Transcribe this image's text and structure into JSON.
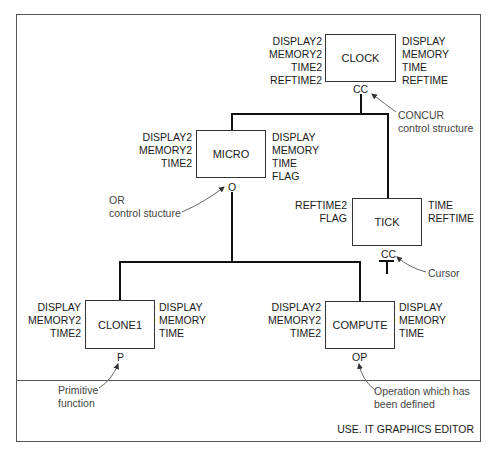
{
  "footer": {
    "title": "USE. IT GRAPHICS EDITOR"
  },
  "nodes": {
    "clock": {
      "name": "CLOCK",
      "inputs": [
        "DISPLAY2",
        "MEMORY2",
        "TIME2",
        "REFTIME2"
      ],
      "outputs": [
        "DISPLAY",
        "MEMORY",
        "TIME",
        "REFTIME"
      ],
      "control": "CC"
    },
    "micro": {
      "name": "MICRO",
      "inputs": [
        "DISPLAY2",
        "MEMORY2",
        "TIME2"
      ],
      "outputs": [
        "DISPLAY",
        "MEMORY",
        "TIME",
        "FLAG"
      ],
      "control": "O"
    },
    "tick": {
      "name": "TICK",
      "inputs": [
        "REFTIME2",
        "FLAG"
      ],
      "outputs": [
        "TIME",
        "REFTIME"
      ],
      "control": "CC"
    },
    "clone1": {
      "name": "CLONE1",
      "inputs": [
        "DISPLAY",
        "MEMORY2",
        "TIME2"
      ],
      "outputs": [
        "DISPLAY",
        "MEMORY",
        "TIME"
      ],
      "control": "P"
    },
    "compute": {
      "name": "COMPUTE",
      "inputs": [
        "DISPLAY2",
        "MEMORY2",
        "TIME2"
      ],
      "outputs": [
        "DISPLAY",
        "MEMORY",
        "TIME"
      ],
      "control": "OP"
    }
  },
  "annotations": {
    "concur": [
      "CONCUR",
      "control structure"
    ],
    "or": [
      "OR",
      "control stucture"
    ],
    "cursor": [
      "Cursor"
    ],
    "primitive": [
      "Primitive",
      "function"
    ],
    "operation": [
      "Operation which has",
      "been defined"
    ]
  },
  "colors": {
    "line": "#111111",
    "frame": "#555555",
    "annotation": "#444444"
  }
}
